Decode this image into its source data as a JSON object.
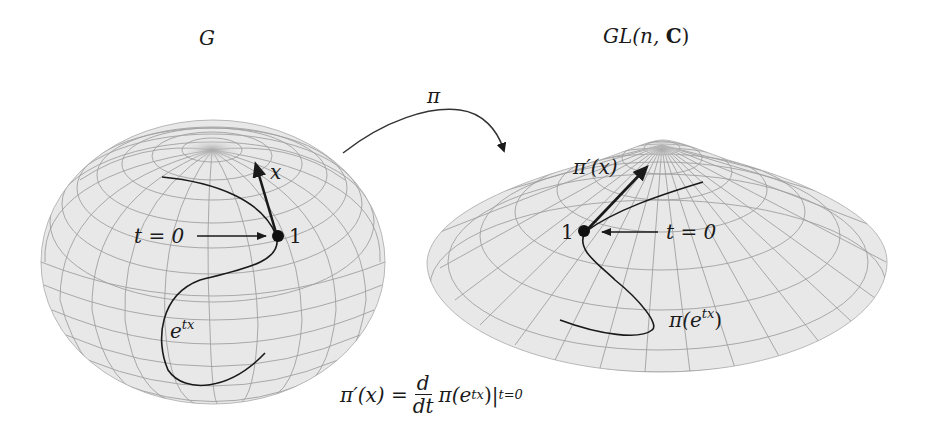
{
  "diagram": {
    "title_left": "G",
    "title_right_prefix": "GL(n, ",
    "title_right_bold": "C",
    "title_right_suffix": ")",
    "map_label": "π",
    "left_surface": {
      "name": "G",
      "shape": "sphere",
      "point_label": "1",
      "vector_label": "x",
      "start_label": "t = 0",
      "curve_label_base": "e",
      "curve_label_exp": "tx"
    },
    "right_surface": {
      "name": "GL(n, C)",
      "shape": "flattened cone",
      "point_label": "1",
      "vector_label_base": "π′(x)",
      "start_label": "t = 0",
      "curve_label_prefix": "π(e",
      "curve_label_exp": "tx",
      "curve_label_suffix": ")"
    },
    "formula": {
      "lhs": "π′(x) =",
      "frac_num": "d",
      "frac_den": "dt",
      "rhs_prefix": "π(e",
      "rhs_exp": "tx",
      "rhs_suffix": ")|",
      "subscript": "t=0"
    },
    "colors": {
      "surface_fill": "#e6e6e6",
      "grid_line": "#9a9a9a",
      "ink": "#1a1a1a",
      "pole_shade": "#b0b0b0"
    }
  }
}
